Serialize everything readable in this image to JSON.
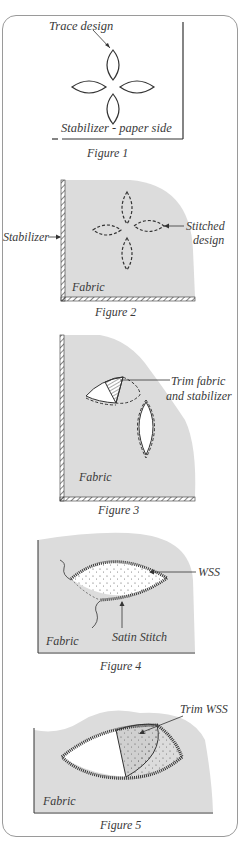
{
  "figures": [
    {
      "caption": "Figure 1",
      "labels": {
        "top": "Trace design",
        "bottom": "Stabilizer - paper side"
      }
    },
    {
      "caption": "Figure 2",
      "labels": {
        "left": "Stabilizer",
        "right_line1": "Stitched",
        "right_line2": "design",
        "fabric": "Fabric"
      }
    },
    {
      "caption": "Figure 3",
      "labels": {
        "right_line1": "Trim fabric",
        "right_line2": "and stabilizer",
        "fabric": "Fabric"
      }
    },
    {
      "caption": "Figure 4",
      "labels": {
        "wss": "WSS",
        "satin": "Satin Stitch",
        "fabric": "Fabric"
      }
    },
    {
      "caption": "Figure 5",
      "labels": {
        "trim": "Trim WSS",
        "fabric": "Fabric"
      }
    }
  ],
  "colors": {
    "fabric": "#dcdcdc",
    "line": "#333333",
    "frame": "#9a9a9a"
  }
}
